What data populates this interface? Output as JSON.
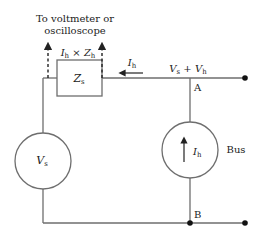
{
  "diagram": {
    "type": "circuit",
    "labels": {
      "measurement_line1": "To voltmeter or",
      "measurement_line2": "oscilloscope",
      "drop_I": "I",
      "drop_I_sub": "h",
      "drop_times": " × ",
      "drop_Z": "Z",
      "drop_Z_sub": "h",
      "impedance_Z": "Z",
      "impedance_sub": "s",
      "current_I": "I",
      "current_sub": "h",
      "bus_V1": "V",
      "bus_V1_sub": "s",
      "bus_plus": " + ",
      "bus_V2": "V",
      "bus_V2_sub": "h",
      "node_A": "A",
      "node_B": "B",
      "source_V": "V",
      "source_V_sub": "s",
      "harmonic_I": "I",
      "harmonic_I_sub": "h",
      "bus": "Bus"
    },
    "colors": {
      "wire": "#6e6e6e",
      "text": "#222222",
      "node": "#111111"
    }
  }
}
